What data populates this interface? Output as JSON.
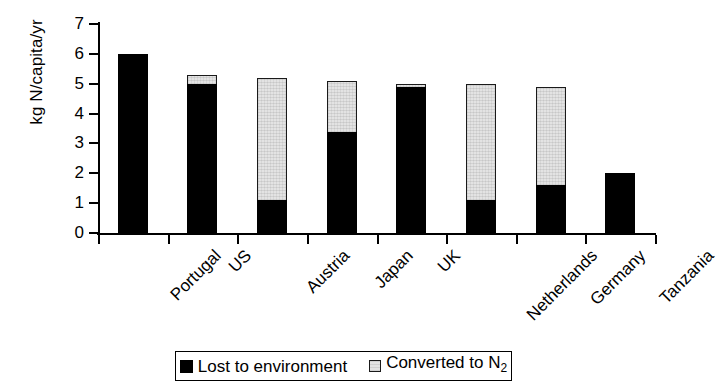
{
  "chart_data": {
    "type": "bar",
    "stacked": true,
    "title": "",
    "subtitle": "",
    "xlabel": "",
    "ylabel": "kg N/capita/yr",
    "ylim": [
      0,
      7
    ],
    "yticks": [
      0,
      1,
      2,
      3,
      4,
      5,
      6,
      7
    ],
    "ytick_labels": [
      "0",
      "1",
      "2",
      "3",
      "4",
      "5",
      "6",
      "7"
    ],
    "grid": false,
    "legend_position": "bottom",
    "categories": [
      "Portugal",
      "US",
      "Austria",
      "Japan",
      "UK",
      "Netherlands",
      "Germany",
      "Tanzania"
    ],
    "series": [
      {
        "name": "Lost to environment",
        "color": "#000000",
        "values": [
          6.0,
          5.0,
          1.1,
          3.4,
          4.9,
          1.1,
          1.6,
          2.0
        ]
      },
      {
        "name": "Converted to N2",
        "color": "#e3e3e3",
        "values": [
          0.0,
          0.3,
          4.1,
          1.7,
          0.1,
          3.9,
          3.3,
          0.0
        ]
      }
    ],
    "totals": [
      6.0,
      5.3,
      5.2,
      5.1,
      5.0,
      5.0,
      4.9,
      2.0
    ]
  },
  "legend": {
    "items": [
      {
        "label": "Lost to environment",
        "swatch": "black"
      },
      {
        "label_prefix": "Converted to N",
        "label_sub": "2",
        "swatch": "grey"
      }
    ]
  }
}
